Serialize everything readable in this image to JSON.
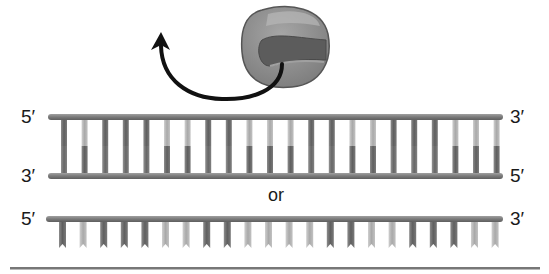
{
  "figure": {
    "caption_partial": "",
    "ribosome": {
      "name": "ribosome",
      "colors": {
        "body": "#8a8a8a",
        "highlight": "#a8a8a8",
        "groove": "#5a5a5a",
        "outline": "#555555"
      }
    },
    "arrow": {
      "color": "#111111",
      "direction": "up-left"
    },
    "double_strand": {
      "top_label_left": "5′",
      "top_label_right": "3′",
      "bottom_label_left": "3′",
      "bottom_label_right": "5′"
    },
    "separator_text": "or",
    "single_strand": {
      "label_left": "5′",
      "label_right": "3′"
    },
    "colors": {
      "backbone": "#7f7f7f",
      "rung_dark": "#6e6e6e",
      "rung_light": "#b5b5b5",
      "rule": "#777777"
    },
    "rung_pattern_double": [
      "dark",
      "light",
      "dark",
      "dark",
      "dark",
      "light",
      "light",
      "dark",
      "dark",
      "light",
      "light",
      "light",
      "dark",
      "dark",
      "light",
      "light",
      "dark",
      "dark",
      "dark",
      "light",
      "light",
      "light"
    ],
    "rung_pattern_single": [
      "dark",
      "light",
      "dark",
      "dark",
      "dark",
      "light",
      "light",
      "dark",
      "dark",
      "light",
      "light",
      "light",
      "light",
      "dark",
      "dark",
      "light",
      "light",
      "dark",
      "dark",
      "dark",
      "light",
      "light"
    ]
  }
}
